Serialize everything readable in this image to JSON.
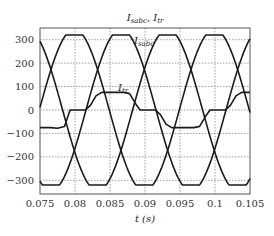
{
  "chart_data": {
    "type": "line",
    "title_main": "I",
    "title_sub1": "sabc",
    "title_sep": ", I",
    "title_sub2": "tr",
    "xlabel": "t (s)",
    "ylabel": "",
    "xlim": [
      0.075,
      0.105
    ],
    "ylim": [
      -350,
      350
    ],
    "xticks": [
      "0.075",
      "0.08",
      "0.085",
      "0.09",
      "0.095",
      "0.1",
      "0.105"
    ],
    "yticks": [
      "300",
      "200",
      "100",
      "0",
      "−100",
      "−200",
      "−300"
    ],
    "ytick_values": [
      300,
      200,
      100,
      0,
      -100,
      -200,
      -300
    ],
    "grid": true,
    "legend": "none",
    "annotations": [
      {
        "text": "I",
        "sub": "sabc",
        "x": 0.0903,
        "y": 300
      },
      {
        "text": "I",
        "sub": "tr",
        "x": 0.0858,
        "y": 85
      }
    ],
    "series": [
      {
        "name": "I_sa",
        "frequency_hz": 50,
        "amplitude": 345,
        "clip": 320,
        "phase_peak_t": 0.0799
      },
      {
        "name": "I_sb",
        "frequency_hz": 50,
        "amplitude": 345,
        "clip": 320,
        "phase_peak_t": 0.08657
      },
      {
        "name": "I_sc",
        "frequency_hz": 50,
        "amplitude": 345,
        "clip": 320,
        "phase_peak_t": 0.09323
      },
      {
        "name": "I_tr",
        "x": [
          0.075,
          0.0765,
          0.0775,
          0.0785,
          0.0793,
          0.0815,
          0.0822,
          0.083,
          0.0838,
          0.087,
          0.0878,
          0.0888,
          0.0893,
          0.0915,
          0.0922,
          0.093,
          0.0938,
          0.097,
          0.0978,
          0.0988,
          0.0993,
          0.1015,
          0.1022,
          0.103,
          0.1038,
          0.105
        ],
        "y": [
          -75,
          -75,
          -78,
          -70,
          0,
          0,
          20,
          60,
          75,
          75,
          70,
          20,
          0,
          0,
          -20,
          -60,
          -75,
          -75,
          -70,
          -20,
          0,
          0,
          20,
          60,
          75,
          75
        ]
      }
    ]
  }
}
